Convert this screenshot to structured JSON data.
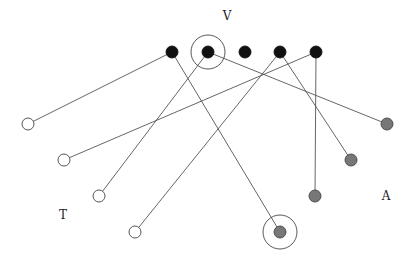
{
  "diagram": {
    "type": "bipartite-graph",
    "labels": [
      {
        "id": "V",
        "text": "V",
        "x": 227,
        "y": 20
      },
      {
        "id": "T",
        "text": "T",
        "x": 63,
        "y": 219
      },
      {
        "id": "A",
        "text": "A",
        "x": 386,
        "y": 200
      }
    ],
    "colors": {
      "black_node": "#111111",
      "white_node": "#ffffff",
      "gray_node": "#777777",
      "edge": "#555555",
      "stroke": "#444444"
    },
    "v_nodes": [
      {
        "id": "v1",
        "x": 172,
        "y": 52
      },
      {
        "id": "v2",
        "x": 208,
        "y": 52,
        "highlighted": true
      },
      {
        "id": "v3",
        "x": 245,
        "y": 52
      },
      {
        "id": "v4",
        "x": 280,
        "y": 52
      },
      {
        "id": "v5",
        "x": 316,
        "y": 52
      }
    ],
    "t_nodes": [
      {
        "id": "t1",
        "x": 28,
        "y": 124
      },
      {
        "id": "t2",
        "x": 64,
        "y": 160
      },
      {
        "id": "t3",
        "x": 99,
        "y": 196
      },
      {
        "id": "t4",
        "x": 135,
        "y": 232
      }
    ],
    "a_nodes": [
      {
        "id": "a1",
        "x": 387,
        "y": 124
      },
      {
        "id": "a2",
        "x": 351,
        "y": 160
      },
      {
        "id": "a3",
        "x": 315,
        "y": 196
      },
      {
        "id": "a4",
        "x": 280,
        "y": 232,
        "highlighted": true
      }
    ],
    "edges": [
      {
        "from": "v1",
        "to": "t1"
      },
      {
        "from": "v1",
        "to": "a4"
      },
      {
        "from": "v2",
        "to": "t3"
      },
      {
        "from": "v2",
        "to": "a1"
      },
      {
        "from": "v4",
        "to": "t4"
      },
      {
        "from": "v4",
        "to": "a2"
      },
      {
        "from": "v5",
        "to": "t2"
      },
      {
        "from": "v5",
        "to": "a3"
      }
    ]
  }
}
